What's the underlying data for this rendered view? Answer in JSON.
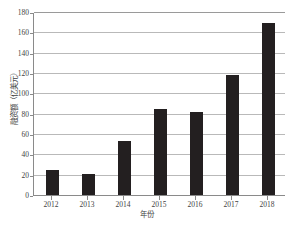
{
  "chart_data": {
    "type": "bar",
    "title": "",
    "xlabel": "年份",
    "ylabel": "融资额（亿美元）",
    "categories": [
      "2012",
      "2013",
      "2014",
      "2015",
      "2016",
      "2017",
      "2018"
    ],
    "values": [
      25,
      20.5,
      53,
      85,
      81.5,
      118,
      169
    ],
    "series": [
      {
        "name": "融资额",
        "values": [
          25,
          20.5,
          53,
          85,
          81.5,
          118,
          169
        ]
      }
    ],
    "ylim": [
      0,
      180
    ],
    "ytick_labels": [
      "0",
      "20",
      "40",
      "60",
      "80",
      "100",
      "120",
      "140",
      "160",
      "180"
    ],
    "ytick_values": [
      0,
      20,
      40,
      60,
      80,
      100,
      120,
      140,
      160,
      180
    ],
    "xlim_categories": 7,
    "grid": "horizontal",
    "legend": "none",
    "bar_color": "#231f20",
    "grid_color": "#b9b9b9",
    "axis_color": "#8a8a8a",
    "annotations": []
  }
}
